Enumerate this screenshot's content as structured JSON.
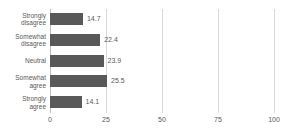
{
  "chart_data": {
    "type": "bar",
    "orientation": "horizontal",
    "title": "",
    "xlabel": "",
    "ylabel": "",
    "categories": [
      "Strongly\ndisagree",
      "Somewhat\ndisagree",
      "Neutral",
      "Somewhat\nagree",
      "Strongly\nagree"
    ],
    "values": [
      14.7,
      22.4,
      23.9,
      25.5,
      14.1
    ],
    "data_labels": [
      "14.7",
      "22.4",
      "23.9",
      "25.5",
      "14.1"
    ],
    "xlim": [
      0,
      100
    ],
    "xticks": [
      0,
      25,
      50,
      75,
      100
    ],
    "xtick_labels": [
      "0",
      "25",
      "50",
      "75",
      "100"
    ],
    "grid": "vertical",
    "legend": "none",
    "bar_color": "#595959",
    "gridline_color": "#d9d9d9",
    "axis_color": "#bfbfbf",
    "text_color": "#595959"
  }
}
